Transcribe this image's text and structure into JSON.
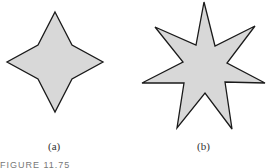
{
  "figure": {
    "panels": [
      {
        "label": "(a)",
        "shape": "four-pointed-star"
      },
      {
        "label": "(b)",
        "shape": "seven-pointed-star"
      }
    ],
    "caption": "FIGURE 11.75",
    "fill_color": "#d8d8d8",
    "stroke_color": "#1a1a1a"
  }
}
